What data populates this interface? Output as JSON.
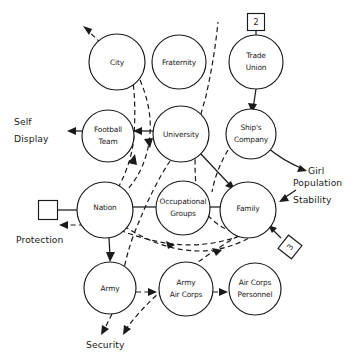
{
  "diagram": {
    "type": "node-link-diagram",
    "width": 353,
    "height": 362,
    "background_color": "#ffffff",
    "ink_color": "#1a1a1a",
    "legend": {
      "solid_line_meaning": "solid directed link",
      "dashed_line_meaning": "dashed directed link"
    },
    "nodes": [
      {
        "id": "city",
        "label": "City",
        "shape": "circle",
        "cx": 117,
        "cy": 62,
        "r": 28
      },
      {
        "id": "fraternity",
        "label": "Fraternity",
        "shape": "circle",
        "cx": 179,
        "cy": 62,
        "r": 27
      },
      {
        "id": "trade-union",
        "label": "Trade\nUnion",
        "shape": "circle",
        "cx": 256,
        "cy": 62,
        "r": 27
      },
      {
        "id": "football-team",
        "label": "Football\nTeam",
        "shape": "circle",
        "cx": 108,
        "cy": 136,
        "r": 26
      },
      {
        "id": "university",
        "label": "University",
        "shape": "circle",
        "cx": 181,
        "cy": 134,
        "r": 28
      },
      {
        "id": "ships-company",
        "label": "Ship's\nCompany",
        "shape": "circle",
        "cx": 251,
        "cy": 134,
        "r": 25
      },
      {
        "id": "nation",
        "label": "Nation",
        "shape": "circle",
        "cx": 105,
        "cy": 210,
        "r": 28
      },
      {
        "id": "occupational-groups",
        "label": "Occupational\nGroups",
        "shape": "circle",
        "cx": 183,
        "cy": 208,
        "r": 27
      },
      {
        "id": "family",
        "label": "Family",
        "shape": "circle",
        "cx": 248,
        "cy": 210,
        "r": 28
      },
      {
        "id": "army",
        "label": "Army",
        "shape": "circle",
        "cx": 110,
        "cy": 288,
        "r": 26
      },
      {
        "id": "army-air-corps",
        "label": "Army\nAir Corps",
        "shape": "circle",
        "cx": 186,
        "cy": 289,
        "r": 27
      },
      {
        "id": "air-corps-personnel",
        "label": "Air Corps\nPersonnel",
        "shape": "circle",
        "cx": 255,
        "cy": 289,
        "r": 26
      }
    ],
    "boxes": [
      {
        "id": "box-two",
        "label": "2",
        "shape": "square",
        "cx": 256,
        "cy": 22,
        "size": 17,
        "rotation": 0
      },
      {
        "id": "box-blank",
        "label": "",
        "shape": "square",
        "cx": 48,
        "cy": 210,
        "size": 19,
        "rotation": 0
      },
      {
        "id": "box-three",
        "label": "3",
        "shape": "square-rotated",
        "cx": 290,
        "cy": 247,
        "size": 17,
        "rotation": -52
      }
    ],
    "free_labels": [
      {
        "id": "self-display",
        "lines": [
          "Self",
          "Display"
        ],
        "x": 14,
        "y": 120,
        "align": "start"
      },
      {
        "id": "protection",
        "lines": [
          "Protection"
        ],
        "x": 16,
        "y": 238,
        "align": "start"
      },
      {
        "id": "girl",
        "lines": [
          "Girl"
        ],
        "x": 308,
        "y": 170,
        "align": "start"
      },
      {
        "id": "population-stability",
        "lines": [
          "Population",
          "Stability"
        ],
        "x": 296,
        "y": 199,
        "align": "start"
      },
      {
        "id": "security",
        "lines": [
          "Security"
        ],
        "x": 86,
        "y": 343,
        "align": "start"
      }
    ],
    "edges": [
      {
        "id": "city-to-upper-left",
        "from": "city",
        "to": "outside-upper-left",
        "style": "dashed",
        "arrow": true
      },
      {
        "id": "trade-union-from-box-two",
        "from": "box-two",
        "to": "trade-union",
        "style": "solid",
        "arrow": false
      },
      {
        "id": "trade-union-to-ships-company",
        "from": "trade-union",
        "to": "ships-company",
        "style": "solid",
        "arrow": true
      },
      {
        "id": "ships-company-to-girl",
        "from": "ships-company",
        "to": "girl",
        "style": "solid",
        "arrow": true
      },
      {
        "id": "football-team-to-self-display",
        "from": "football-team",
        "to": "self-display",
        "style": "solid",
        "arrow": true
      },
      {
        "id": "university-to-football-team",
        "from": "university",
        "to": "football-team",
        "style": "solid",
        "arrow": true
      },
      {
        "id": "box-blank-to-nation",
        "from": "box-blank",
        "to": "nation",
        "style": "solid",
        "arrow": false
      },
      {
        "id": "nation-to-protection",
        "from": "nation",
        "to": "protection",
        "style": "dashed",
        "arrow": true
      },
      {
        "id": "nation-to-army",
        "from": "nation",
        "to": "army",
        "style": "solid",
        "arrow": true
      },
      {
        "id": "nation-to-occupational-groups",
        "from": "nation",
        "to": "occupational-groups",
        "style": "solid",
        "arrow": false
      },
      {
        "id": "occupational-groups-to-family",
        "from": "occupational-groups",
        "to": "family",
        "style": "solid",
        "arrow": true
      },
      {
        "id": "university-to-family",
        "from": "university",
        "to": "family",
        "style": "solid",
        "arrow": true
      },
      {
        "id": "box-three-to-family",
        "from": "box-three",
        "to": "family",
        "style": "solid",
        "arrow": true
      },
      {
        "id": "family-to-population-stability",
        "from": "family",
        "to": "population-stability",
        "style": "solid",
        "arrow": true
      },
      {
        "id": "army-air-corps-to-personnel",
        "from": "army-air-corps",
        "to": "air-corps-personnel",
        "style": "dashed",
        "arrow": true
      },
      {
        "id": "army-to-army-air-corps",
        "from": "army",
        "to": "army-air-corps",
        "style": "dashed",
        "arrow": true
      },
      {
        "id": "army-to-security",
        "from": "army",
        "to": "security",
        "style": "dashed",
        "arrow": true
      },
      {
        "id": "family-to-security",
        "from": "family",
        "to": "security",
        "style": "dashed",
        "arrow": true
      },
      {
        "id": "city-to-nation-down",
        "from": "city",
        "to": "nation",
        "style": "dashed",
        "arrow": true
      },
      {
        "id": "nation-to-city-up",
        "from": "nation",
        "to": "city",
        "style": "dashed",
        "arrow": true
      },
      {
        "id": "family-to-fraternity-up",
        "from": "family",
        "to": "fraternity-top",
        "style": "dashed",
        "arrow": true
      },
      {
        "id": "family-to-nation-lower",
        "from": "family",
        "to": "nation",
        "style": "dashed",
        "arrow": true
      },
      {
        "id": "nation-to-family-lower",
        "from": "nation",
        "to": "family",
        "style": "dashed",
        "arrow": true
      },
      {
        "id": "university-down-dashed",
        "from": "university",
        "to": "lower-left",
        "style": "dashed",
        "arrow": false
      }
    ]
  }
}
